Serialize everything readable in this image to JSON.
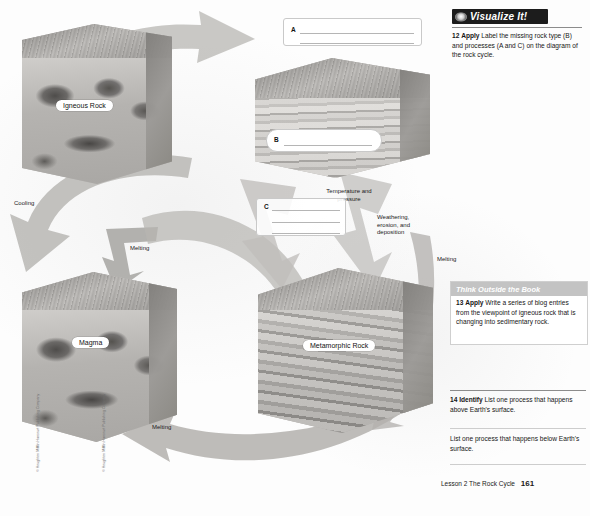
{
  "page": {
    "footer_lesson": "Lesson 2 The Rock Cycle",
    "footer_page": "161",
    "copyright_left": "© Houghton Mifflin Harcourt Publishing Company",
    "copyright_right": "© Houghton Mifflin Harcourt Publishing Company"
  },
  "diagram": {
    "title": "The Rock Cycle",
    "labels": {
      "igneous": "Igneous Rock",
      "magma": "Magma",
      "metamorphic": "Metamorphic Rock"
    },
    "process_labels": {
      "cooling": "Cooling",
      "melting_left": "Melting",
      "melting_bottom": "Melting",
      "melting_right": "Melting",
      "temperature_pressure": "Temperature and pressure",
      "weathering": "Weathering, erosion, and deposition"
    },
    "blanks": [
      {
        "letter": "A",
        "value": "",
        "lines": 2
      },
      {
        "letter": "B",
        "value": "",
        "lines": 1
      },
      {
        "letter": "C",
        "value": "",
        "lines": 3
      }
    ]
  },
  "visualize": {
    "header": "Visualize It!",
    "icon": "eye-icon",
    "question_number": "12",
    "question_verb": "Apply",
    "question_text": "Label the missing rock type (B) and processes (A and C) on the diagram of the rock cycle."
  },
  "think_outside_book": {
    "header": "Think Outside the Book",
    "question_number": "13",
    "question_verb": "Apply",
    "question_text": "Write a series of blog entries from the viewpoint of igneous rock that is changing into sedimentary rock."
  },
  "identify": {
    "question_number": "14",
    "question_verb": "Identify",
    "prompt_one": "List one process that happens above Earth's surface.",
    "answer_one": "",
    "prompt_two": "List one process that happens below Earth's surface.",
    "answer_two": ""
  },
  "colors": {
    "header_bg": "#1c1c1c",
    "header_text": "#ffffff",
    "tob_header_bg": "#c3c3c3",
    "arrow_fill": "#b6b4b1",
    "page_bg": "#ffffff"
  }
}
